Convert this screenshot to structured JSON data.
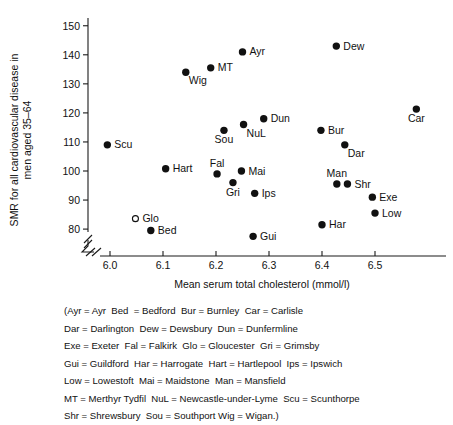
{
  "chart_data": {
    "type": "scatter",
    "title": "",
    "xlabel": "Mean serum total cholesterol (mmol/l)",
    "ylabel": "SMR for all cardiovascular disease in men aged 35–64",
    "xlim": [
      5.94,
      6.62
    ],
    "ylim": [
      74,
      152
    ],
    "xticks": [
      "6.0",
      "6.1",
      "6.2",
      "6.3",
      "6.4",
      "6.5"
    ],
    "xtick_values": [
      6.0,
      6.1,
      6.2,
      6.3,
      6.4,
      6.5
    ],
    "yticks": [
      "80",
      "90",
      "100",
      "110",
      "120",
      "130",
      "140",
      "150"
    ],
    "ytick_values": [
      80,
      90,
      100,
      110,
      120,
      130,
      140,
      150
    ],
    "grid": false,
    "legend_position": "below-plot",
    "axis_break_x": true,
    "axis_break_y": true,
    "points": [
      {
        "label": "Scu",
        "x": 5.995,
        "y": 109.0,
        "marker": "filled",
        "label_pos": "right"
      },
      {
        "label": "Glo",
        "x": 6.048,
        "y": 83.6,
        "marker": "open",
        "label_pos": "right"
      },
      {
        "label": "Bed",
        "x": 6.077,
        "y": 79.5,
        "marker": "filled",
        "label_pos": "right"
      },
      {
        "label": "Hart",
        "x": 6.105,
        "y": 100.8,
        "marker": "filled",
        "label_pos": "right"
      },
      {
        "label": "Wig",
        "x": 6.143,
        "y": 134.0,
        "marker": "filled",
        "label_pos": "below-right"
      },
      {
        "label": "MT",
        "x": 6.19,
        "y": 135.5,
        "marker": "filled",
        "label_pos": "right"
      },
      {
        "label": "Fal",
        "x": 6.202,
        "y": 99.0,
        "marker": "filled",
        "label_pos": "above"
      },
      {
        "label": "Sou",
        "x": 6.215,
        "y": 114.0,
        "marker": "filled",
        "label_pos": "below"
      },
      {
        "label": "Gri",
        "x": 6.232,
        "y": 96.0,
        "marker": "filled",
        "label_pos": "below"
      },
      {
        "label": "Mai",
        "x": 6.248,
        "y": 100.0,
        "marker": "filled",
        "label_pos": "right"
      },
      {
        "label": "Ayr",
        "x": 6.25,
        "y": 141.0,
        "marker": "filled",
        "label_pos": "right"
      },
      {
        "label": "NuL",
        "x": 6.252,
        "y": 116.0,
        "marker": "filled",
        "label_pos": "below-right"
      },
      {
        "label": "Gui",
        "x": 6.27,
        "y": 77.5,
        "marker": "filled",
        "label_pos": "right"
      },
      {
        "label": "Ips",
        "x": 6.273,
        "y": 92.3,
        "marker": "filled",
        "label_pos": "right"
      },
      {
        "label": "Dun",
        "x": 6.29,
        "y": 118.0,
        "marker": "filled",
        "label_pos": "right"
      },
      {
        "label": "Bur",
        "x": 6.398,
        "y": 114.0,
        "marker": "filled",
        "label_pos": "right"
      },
      {
        "label": "Har",
        "x": 6.4,
        "y": 81.5,
        "marker": "filled",
        "label_pos": "right"
      },
      {
        "label": "Dew",
        "x": 6.427,
        "y": 143.0,
        "marker": "filled",
        "label_pos": "right"
      },
      {
        "label": "Man",
        "x": 6.428,
        "y": 95.5,
        "marker": "filled",
        "label_pos": "above"
      },
      {
        "label": "Dar",
        "x": 6.443,
        "y": 109.0,
        "marker": "filled",
        "label_pos": "below-right"
      },
      {
        "label": "Shr",
        "x": 6.448,
        "y": 95.5,
        "marker": "filled",
        "label_pos": "right"
      },
      {
        "label": "Exe",
        "x": 6.495,
        "y": 91.0,
        "marker": "filled",
        "label_pos": "right"
      },
      {
        "label": "Low",
        "x": 6.5,
        "y": 85.5,
        "marker": "filled",
        "label_pos": "right"
      },
      {
        "label": "Car",
        "x": 6.578,
        "y": 121.3,
        "marker": "filled",
        "label_pos": "below"
      }
    ],
    "legend_lines": [
      "(Ayr = Ayr  Bed  = Bedford  Bur = Burnley  Car = Carlisle",
      "Dar = Darlington  Dew = Dewsbury  Dun = Dunfermline",
      "Exe = Exeter  Fal = Falkirk  Glo = Gloucester  Gri = Grimsby",
      "Gui = Guildford  Har = Harrogate  Hart = Hartlepool  Ips = Ipswich",
      "Low = Lowestoft  Mai = Maidstone  Man = Mansfield",
      "MT = Merthyr Tydfil  NuL = Newcastle-under-Lyme  Scu = Scunthorpe",
      "Shr = Shrewsbury  Sou = Southport Wig = Wigan.)"
    ]
  }
}
